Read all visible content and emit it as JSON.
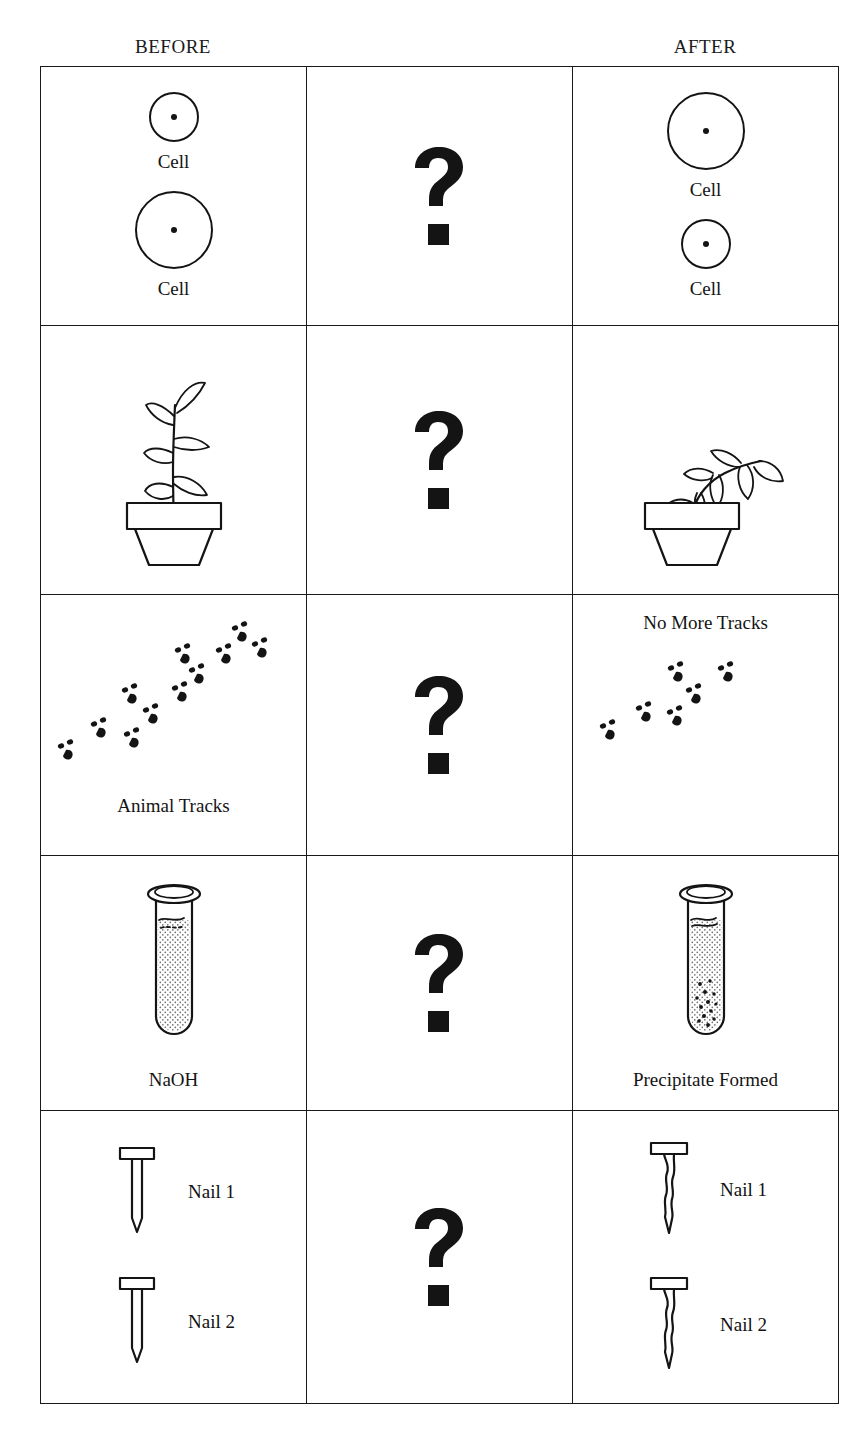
{
  "header": {
    "before": "BEFORE",
    "middle": "",
    "after": "AFTER"
  },
  "middle_column": {
    "symbol": "?",
    "icon": "question-mark-icon"
  },
  "rows": [
    {
      "id": "cells",
      "before": {
        "labels": [
          "Cell",
          "Cell"
        ],
        "shapes": [
          {
            "kind": "cell-circle",
            "size": "small"
          },
          {
            "kind": "cell-circle",
            "size": "large"
          }
        ]
      },
      "middle": {
        "symbol": "?"
      },
      "after": {
        "labels": [
          "Cell",
          "Cell"
        ],
        "shapes": [
          {
            "kind": "cell-circle",
            "size": "large"
          },
          {
            "kind": "cell-circle",
            "size": "small"
          }
        ]
      }
    },
    {
      "id": "plant",
      "before": {
        "labels": [],
        "shapes": [
          {
            "kind": "potted-plant",
            "state": "healthy"
          }
        ]
      },
      "middle": {
        "symbol": "?"
      },
      "after": {
        "labels": [],
        "shapes": [
          {
            "kind": "potted-plant",
            "state": "wilted"
          }
        ]
      }
    },
    {
      "id": "tracks",
      "before": {
        "labels": [
          "Animal Tracks"
        ],
        "shapes": [
          {
            "kind": "animal-tracks",
            "count": 11
          }
        ]
      },
      "middle": {
        "symbol": "?"
      },
      "after": {
        "labels": [
          "No More Tracks"
        ],
        "shapes": [
          {
            "kind": "animal-tracks",
            "count": 6
          }
        ]
      }
    },
    {
      "id": "test-tube",
      "before": {
        "labels": [
          "NaOH"
        ],
        "shapes": [
          {
            "kind": "test-tube",
            "state": "clear"
          }
        ]
      },
      "middle": {
        "symbol": "?"
      },
      "after": {
        "labels": [
          "Precipitate Formed"
        ],
        "shapes": [
          {
            "kind": "test-tube",
            "state": "precipitate"
          }
        ]
      }
    },
    {
      "id": "nails",
      "before": {
        "labels": [
          "Nail 1",
          "Nail 2"
        ],
        "shapes": [
          {
            "kind": "nail",
            "state": "clean"
          },
          {
            "kind": "nail",
            "state": "clean"
          }
        ]
      },
      "middle": {
        "symbol": "?"
      },
      "after": {
        "labels": [
          "Nail 1",
          "Nail 2"
        ],
        "shapes": [
          {
            "kind": "nail",
            "state": "corroded"
          },
          {
            "kind": "nail",
            "state": "corroded"
          }
        ]
      }
    }
  ],
  "colors": {
    "ink": "#141414",
    "paper": "#ffffff",
    "rule": "#1a1a1a"
  }
}
